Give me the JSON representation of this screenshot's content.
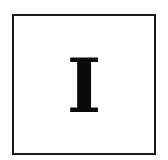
{
  "tile": {
    "letter": "I",
    "border_color": "#1a1a1a",
    "text_color": "#0a0a0a",
    "background": "#ffffff"
  }
}
